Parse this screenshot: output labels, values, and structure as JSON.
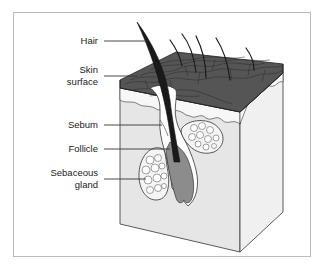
{
  "diagram": {
    "labels": [
      {
        "id": "hair",
        "text": "Hair"
      },
      {
        "id": "skin_surface",
        "text": "Skin\nsurface",
        "line1": "Skin",
        "line2": "surface"
      },
      {
        "id": "sebum",
        "text": "Sebum"
      },
      {
        "id": "follicle",
        "text": "Follicle"
      },
      {
        "id": "sebaceous_gland",
        "text": "Sebaceous\ngland",
        "line1": "Sebaceous",
        "line2": "gland"
      }
    ],
    "colors": {
      "skin_surface": "#555555",
      "hair": "#1a1a1a",
      "tissue": "#e6e6e6",
      "tissue_side": "#f2f2f2",
      "follicle_bulb": "#8c8c8c",
      "frame": "#bbbbbb",
      "leader_line": "#333333"
    }
  }
}
